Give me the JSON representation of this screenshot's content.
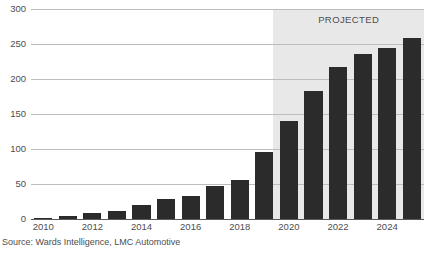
{
  "chart_data": {
    "type": "bar",
    "title": "",
    "subtitle": "",
    "xlabel": "",
    "ylabel": "",
    "categories": [
      "2010",
      "2011",
      "2012",
      "2013",
      "2014",
      "2015",
      "2016",
      "2017",
      "2018",
      "2019",
      "2020",
      "2021",
      "2022",
      "2023",
      "2024",
      "2025"
    ],
    "values": [
      1,
      5,
      8,
      12,
      20,
      29,
      33,
      47,
      56,
      96,
      140,
      183,
      217,
      236,
      245,
      258
    ],
    "ylim": [
      0,
      300
    ],
    "yticks": [
      0,
      50,
      100,
      150,
      200,
      250,
      300
    ],
    "ytick_labels": [
      "0",
      "50",
      "100",
      "150",
      "200",
      "250",
      "300"
    ],
    "xtick_labels": [
      "2010",
      "2012",
      "2014",
      "2016",
      "2018",
      "2020",
      "2022",
      "2024"
    ],
    "xtick_categories": [
      "2010",
      "2012",
      "2014",
      "2016",
      "2018",
      "2020",
      "2022",
      "2024"
    ],
    "grid": true,
    "legend": "none",
    "bar_color": "#2b2b2b",
    "grid_color": "#bcbcbc",
    "axis_color": "#58595b",
    "annotations": [
      {
        "text": "PROJECTED",
        "starts_at_category": "2020",
        "shaded_region_color": "#e8e8e8"
      }
    ],
    "projected_from": "2020",
    "source": "Source: Wards Intelligence, LMC Automotive"
  },
  "labels": {
    "projected": "PROJECTED",
    "source": "Source: Wards Intelligence, LMC Automotive"
  }
}
